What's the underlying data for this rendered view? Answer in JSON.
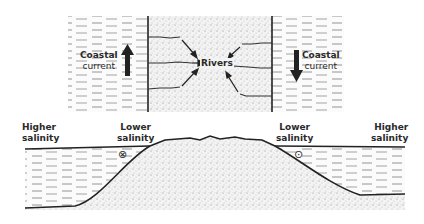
{
  "diagram": {
    "plan_view": {
      "left_water": {
        "label_line1": "Coastal",
        "label_line2": "current",
        "arrow_direction": "up"
      },
      "right_water": {
        "label_line1": "Coastal",
        "label_line2": "current",
        "arrow_direction": "down"
      },
      "land": {
        "label": "Rivers",
        "river_count_left": 3,
        "river_count_right": 3
      }
    },
    "cross_section": {
      "left_outer": {
        "line1": "Higher",
        "line2": "salinity"
      },
      "left_inner": {
        "line1": "Lower",
        "line2": "salinity",
        "symbol": "⊗"
      },
      "right_inner": {
        "line1": "Lower",
        "line2": "salinity",
        "symbol": "⊙"
      },
      "right_outer": {
        "line1": "Higher",
        "line2": "salinity"
      }
    },
    "colors": {
      "ink": "#222222",
      "stipple": "#cfcfcf",
      "background": "#ffffff"
    }
  }
}
